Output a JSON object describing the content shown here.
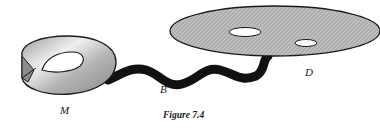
{
  "figure": {
    "caption": "Figure 7.4",
    "labels": {
      "mobius": "M",
      "band": "B",
      "disk": "D"
    },
    "colors": {
      "surface_fill": "#a8a8a8",
      "surface_highlight": "#ececec",
      "outline": "#1a1a1a",
      "band": "#111111",
      "background": "#ffffff"
    },
    "elements": [
      {
        "id": "mobius-band",
        "description": "Möbius band surface"
      },
      {
        "id": "connecting-band",
        "description": "black wavy band connecting M to D"
      },
      {
        "id": "disk",
        "description": "flat disk with two holes"
      }
    ]
  }
}
